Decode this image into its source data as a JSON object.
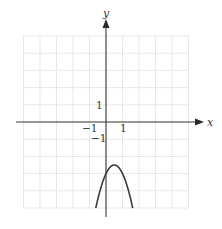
{
  "chart_data": {
    "type": "line",
    "title": "",
    "xlabel": "x",
    "ylabel": "y",
    "xlim": [
      -5,
      5
    ],
    "ylim": [
      -5,
      5
    ],
    "grid": true,
    "tick_labels": {
      "x": [
        {
          "value": -1,
          "label": "−1"
        },
        {
          "value": 1,
          "label": "1"
        }
      ],
      "y": [
        {
          "value": 1,
          "label": "1"
        },
        {
          "value": -1,
          "label": "−1"
        }
      ]
    },
    "series": [
      {
        "name": "downward parabola",
        "equation": "y = -2(x - 0.5)^2 - 2.5",
        "vertex": [
          0.5,
          -2.5
        ],
        "y_intercept": -3,
        "x": [
          -0.62,
          -0.4,
          -0.2,
          0,
          0.2,
          0.4,
          0.5,
          0.6,
          0.8,
          1.0,
          1.2,
          1.4,
          1.62
        ],
        "values": [
          -5.0,
          -4.12,
          -3.48,
          -3.0,
          -2.68,
          -2.52,
          -2.5,
          -2.52,
          -2.68,
          -3.0,
          -3.48,
          -4.12,
          -5.0
        ]
      }
    ],
    "legend": null
  },
  "labels": {
    "x_axis": "x",
    "y_axis": "y",
    "x_tick_neg1": "−1",
    "x_tick_1": "1",
    "y_tick_1": "1",
    "y_tick_neg1": "−1"
  },
  "colors": {
    "axis": "#3a3a3a",
    "grid": "#cfcfcf",
    "curve": "#3a3a3a"
  }
}
